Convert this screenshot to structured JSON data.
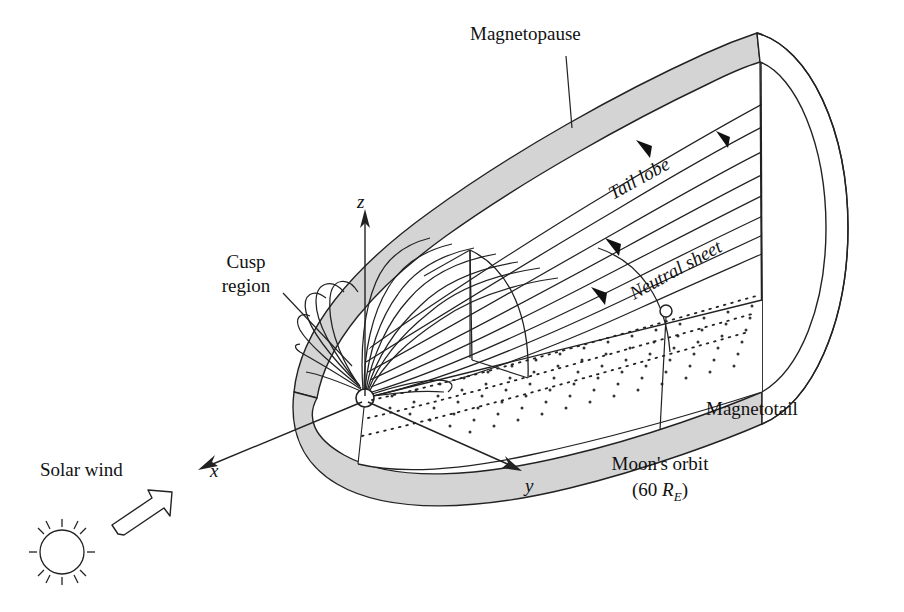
{
  "figure": {
    "background_color": "#ffffff",
    "line_color": "#111111",
    "band_fill_color": "#d4d4d4",
    "earth_fill_color": "#ffffff"
  },
  "labels": {
    "magnetopause": "Magnetopause",
    "tail_lobe": "Tail lobe",
    "neutral_sheet": "Neutral sheet",
    "cusp_region_line1": "Cusp",
    "cusp_region_line2": "region",
    "magnetotail": "Magnetotail",
    "moons_orbit_line1": "Moon's orbit",
    "moons_orbit_paren_open": "(60 ",
    "moons_orbit_symbol": "R",
    "moons_orbit_subscript": "E",
    "moons_orbit_paren_close": ")",
    "solar_wind": "Solar wind"
  },
  "axes": {
    "x": "x",
    "y": "y",
    "z": "z"
  },
  "icons": {
    "sun": "sun-icon",
    "solar_wind_arrow": "block-arrow-icon",
    "earth": "earth-circle-icon",
    "moon": "moon-marker-icon",
    "flow_arrow": "flow-arrowhead-icon"
  }
}
